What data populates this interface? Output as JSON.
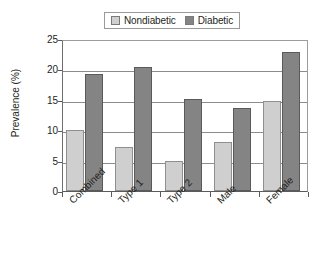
{
  "chart_data": {
    "type": "bar",
    "title": "",
    "xlabel": "",
    "ylabel": "Prevalence (%)",
    "ylim": [
      0,
      25
    ],
    "yticks": [
      0,
      5,
      10,
      15,
      20,
      25
    ],
    "grid": "horizontal",
    "legend_position": "top-center",
    "categories": [
      "Combined",
      "Type 1",
      "Type 2",
      "Male",
      "Female"
    ],
    "series": [
      {
        "name": "Nondiabetic",
        "color": "#cfcfcf",
        "values": [
          10.1,
          7.3,
          4.9,
          8.0,
          14.8
        ]
      },
      {
        "name": "Diabetic",
        "color": "#848484",
        "values": [
          19.3,
          20.4,
          15.2,
          13.6,
          22.8
        ]
      }
    ]
  },
  "legend": {
    "items": [
      {
        "label": "Nondiabetic"
      },
      {
        "label": "Diabetic"
      }
    ]
  },
  "axes": {
    "y_title": "Prevalence (%)",
    "y_tick_labels": [
      "25",
      "20",
      "15",
      "10",
      "5",
      "0"
    ],
    "x_tick_labels": [
      "Combined",
      "Type 1",
      "Type 2",
      "Male",
      "Female"
    ]
  }
}
